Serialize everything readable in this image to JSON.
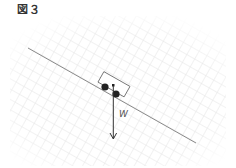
{
  "figure": {
    "title": "図３",
    "force_label": "W"
  },
  "colors": {
    "grid": "#e6e6e6",
    "slope": "#888888",
    "arrow": "#333333",
    "car_outline": "#666666",
    "wheel": "#222222"
  }
}
